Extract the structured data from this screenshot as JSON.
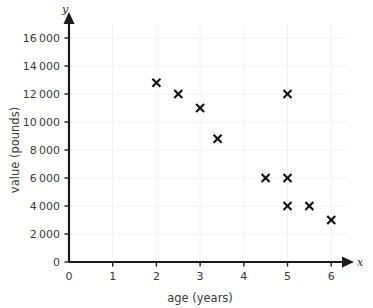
{
  "chart_data": {
    "type": "scatter",
    "title": "",
    "xlabel": "age (years)",
    "ylabel": "value (pounds)",
    "x_axis_variable": "x",
    "y_axis_variable": "y",
    "xlim": [
      0,
      6.35
    ],
    "ylim": [
      0,
      17000
    ],
    "x_ticks": [
      0,
      1,
      2,
      3,
      4,
      5,
      6
    ],
    "x_tick_labels": [
      "0",
      "1",
      "2",
      "3",
      "4",
      "5",
      "6"
    ],
    "y_ticks": [
      0,
      2000,
      4000,
      6000,
      8000,
      10000,
      12000,
      14000,
      16000
    ],
    "y_tick_labels": [
      "0",
      "2000",
      "4000",
      "6000",
      "8000",
      "10000",
      "12000",
      "14000",
      "16000"
    ],
    "grid": true,
    "legend": null,
    "marker": "x",
    "marker_color": "#141414",
    "points": [
      {
        "x": 2,
        "y": 12800
      },
      {
        "x": 2.5,
        "y": 12000
      },
      {
        "x": 3,
        "y": 11000
      },
      {
        "x": 3.4,
        "y": 8800
      },
      {
        "x": 5,
        "y": 12000
      },
      {
        "x": 4.5,
        "y": 6000
      },
      {
        "x": 5,
        "y": 6000
      },
      {
        "x": 5,
        "y": 4000
      },
      {
        "x": 5.5,
        "y": 4000
      },
      {
        "x": 6,
        "y": 3000
      }
    ]
  },
  "colors": {
    "background": "#ffffff",
    "axis": "#1a1a1a",
    "grid": "#f2f2f2",
    "text": "#3b3b3b",
    "marker": "#141414"
  }
}
